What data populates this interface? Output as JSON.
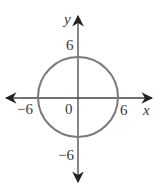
{
  "diagram": {
    "type": "circle-on-axes",
    "equation_implied": "x^2 + y^2 = 36",
    "center": [
      0,
      0
    ],
    "radius": 6,
    "axes": {
      "x_label": "x",
      "y_label": "y",
      "origin_label": "0"
    },
    "ticks": {
      "x_pos": "6",
      "x_neg": "−6",
      "y_pos": "6",
      "y_neg": "−6"
    },
    "colors": {
      "axis": "#222222",
      "circle": "#7a7a7a",
      "text": "#3a3a3a"
    }
  }
}
